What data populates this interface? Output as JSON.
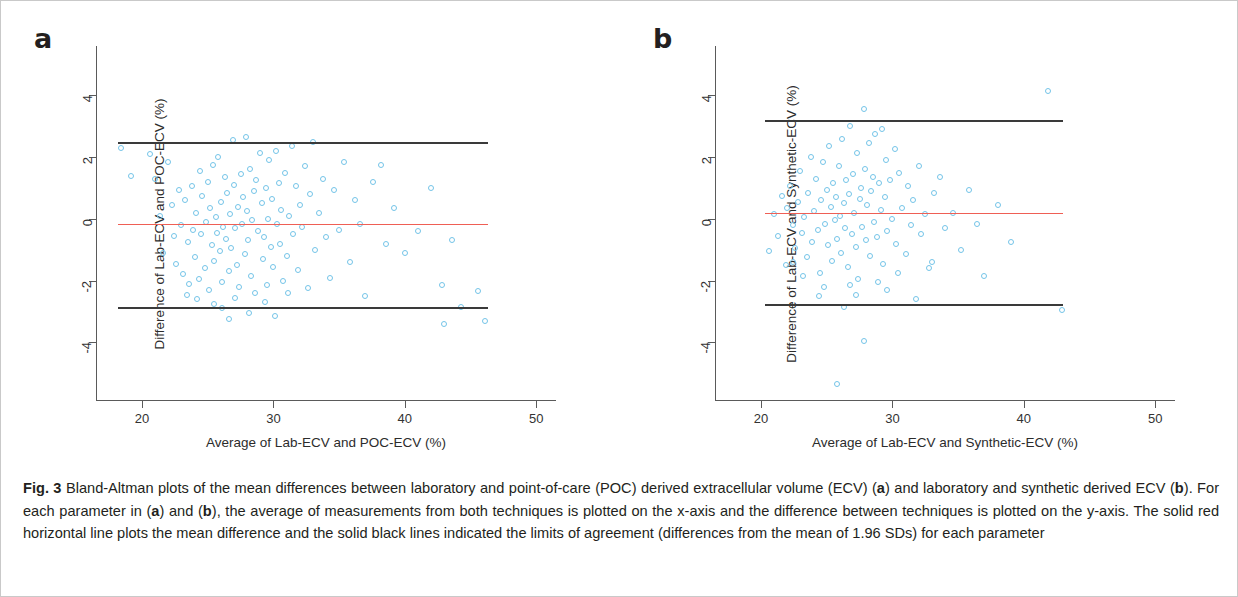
{
  "figure": {
    "label": "Fig. 3",
    "caption": "Bland-Altman plots of the mean differences between laboratory and point-of-care (POC) derived extracellular volume (ECV) (a) and laboratory and synthetic derived ECV (b). For each parameter in (a) and (b), the average of measurements from both techniques is plotted on the x-axis and the difference between techniques is plotted on the y-axis. The solid red horizontal line plots the mean difference and the solid black lines indicated the limits of agreement (differences from the mean of 1.96 SDs) for each parameter",
    "panel_a_letter": "a",
    "panel_b_letter": "b",
    "colors": {
      "points": "#74c4e8",
      "mean_line": "#ef5f55",
      "loa_line": "#3a3a3a",
      "axis": "#5a5a5a"
    }
  },
  "chart_data": [
    {
      "type": "scatter",
      "panel": "a",
      "title": "",
      "xlabel": "Average of Lab-ECV and POC-ECV (%)",
      "ylabel": "Difference of Lab-ECV and POC-ECV (%)",
      "xlim": [
        16.5,
        51.5
      ],
      "ylim": [
        -5.9,
        5.6
      ],
      "xticks": [
        20,
        30,
        40,
        50
      ],
      "yticks": [
        -4,
        -2,
        0,
        2,
        4
      ],
      "grid": false,
      "legend": "none",
      "mean_difference": -0.15,
      "upper_limit_of_agreement": 2.5,
      "lower_limit_of_agreement": -2.85,
      "reference_line_x_range": [
        18.2,
        46.3
      ],
      "points": [
        [
          18.4,
          2.3
        ],
        [
          19.2,
          1.4
        ],
        [
          20.6,
          2.1
        ],
        [
          21.0,
          1.3
        ],
        [
          21.4,
          0.1
        ],
        [
          21.6,
          -1.1
        ],
        [
          22.0,
          1.85
        ],
        [
          22.3,
          0.45
        ],
        [
          22.4,
          -0.55
        ],
        [
          22.6,
          -1.45
        ],
        [
          22.8,
          0.95
        ],
        [
          23.0,
          -0.2
        ],
        [
          23.1,
          -1.8
        ],
        [
          23.3,
          0.6
        ],
        [
          23.5,
          -0.75
        ],
        [
          23.6,
          -2.1
        ],
        [
          23.8,
          1.05
        ],
        [
          23.9,
          -0.35
        ],
        [
          24.0,
          -1.25
        ],
        [
          24.1,
          0.2
        ],
        [
          24.3,
          -1.95
        ],
        [
          24.4,
          1.55
        ],
        [
          24.5,
          -0.5
        ],
        [
          24.6,
          0.75
        ],
        [
          24.8,
          -1.6
        ],
        [
          24.9,
          -0.1
        ],
        [
          25.0,
          1.2
        ],
        [
          25.1,
          -2.3
        ],
        [
          25.2,
          0.35
        ],
        [
          25.3,
          -0.85
        ],
        [
          25.4,
          1.75
        ],
        [
          25.5,
          -1.35
        ],
        [
          25.6,
          0.05
        ],
        [
          25.7,
          -0.45
        ],
        [
          25.8,
          2.0
        ],
        [
          25.9,
          -1.05
        ],
        [
          26.0,
          0.55
        ],
        [
          26.1,
          -2.05
        ],
        [
          26.2,
          -0.25
        ],
        [
          26.3,
          1.35
        ],
        [
          26.4,
          -0.65
        ],
        [
          26.5,
          0.85
        ],
        [
          26.6,
          -1.7
        ],
        [
          26.7,
          0.15
        ],
        [
          26.8,
          -0.95
        ],
        [
          26.9,
          2.55
        ],
        [
          27.0,
          1.1
        ],
        [
          27.1,
          -0.3
        ],
        [
          27.2,
          -1.5
        ],
        [
          27.3,
          0.4
        ],
        [
          27.4,
          -2.2
        ],
        [
          27.5,
          1.45
        ],
        [
          27.6,
          -0.15
        ],
        [
          27.7,
          0.7
        ],
        [
          27.8,
          -1.15
        ],
        [
          27.9,
          2.65
        ],
        [
          28.0,
          0.25
        ],
        [
          28.1,
          -0.7
        ],
        [
          28.2,
          1.6
        ],
        [
          28.3,
          -1.85
        ],
        [
          28.4,
          -0.05
        ],
        [
          28.5,
          0.9
        ],
        [
          28.6,
          -2.4
        ],
        [
          28.7,
          1.25
        ],
        [
          28.8,
          -0.4
        ],
        [
          29.0,
          2.15
        ],
        [
          29.1,
          0.5
        ],
        [
          29.2,
          -1.3
        ],
        [
          29.3,
          -0.6
        ],
        [
          29.4,
          1.0
        ],
        [
          29.5,
          -2.15
        ],
        [
          29.6,
          0.0
        ],
        [
          29.7,
          1.9
        ],
        [
          29.8,
          -0.9
        ],
        [
          29.9,
          0.65
        ],
        [
          30.0,
          -1.55
        ],
        [
          30.2,
          2.2
        ],
        [
          30.3,
          -0.15
        ],
        [
          30.4,
          1.15
        ],
        [
          30.5,
          -0.8
        ],
        [
          30.6,
          0.3
        ],
        [
          30.7,
          -2.0
        ],
        [
          30.9,
          1.5
        ],
        [
          31.0,
          -1.2
        ],
        [
          31.2,
          0.1
        ],
        [
          31.4,
          2.35
        ],
        [
          31.5,
          -0.5
        ],
        [
          31.7,
          1.05
        ],
        [
          31.9,
          -1.65
        ],
        [
          32.0,
          0.45
        ],
        [
          32.2,
          -0.25
        ],
        [
          32.4,
          1.7
        ],
        [
          32.6,
          -2.25
        ],
        [
          32.8,
          0.8
        ],
        [
          33.0,
          2.5
        ],
        [
          33.2,
          -1.0
        ],
        [
          33.5,
          0.2
        ],
        [
          33.8,
          1.3
        ],
        [
          34.0,
          -0.6
        ],
        [
          34.3,
          -1.9
        ],
        [
          34.6,
          0.95
        ],
        [
          35.0,
          -0.35
        ],
        [
          35.4,
          1.85
        ],
        [
          35.8,
          -1.4
        ],
        [
          36.2,
          0.6
        ],
        [
          36.6,
          -0.15
        ],
        [
          37.0,
          -2.5
        ],
        [
          37.6,
          1.2
        ],
        [
          38.2,
          1.75
        ],
        [
          38.6,
          -0.8
        ],
        [
          39.2,
          0.35
        ],
        [
          40.0,
          -1.1
        ],
        [
          41.0,
          -0.4
        ],
        [
          42.0,
          1.0
        ],
        [
          42.8,
          -2.15
        ],
        [
          43.0,
          -3.4
        ],
        [
          43.6,
          -0.7
        ],
        [
          44.3,
          -2.85
        ],
        [
          45.6,
          -2.35
        ],
        [
          46.1,
          -3.3
        ],
        [
          24.2,
          -2.6
        ],
        [
          25.45,
          -2.75
        ],
        [
          26.05,
          -2.9
        ],
        [
          27.05,
          -2.55
        ],
        [
          28.15,
          -3.05
        ],
        [
          23.4,
          -2.45
        ],
        [
          29.35,
          -2.7
        ],
        [
          30.1,
          -3.15
        ],
        [
          31.1,
          -2.4
        ],
        [
          26.6,
          -3.25
        ]
      ]
    },
    {
      "type": "scatter",
      "panel": "b",
      "title": "",
      "xlabel": "Average of Lab-ECV and Synthetic-ECV (%)",
      "ylabel": "Difference of Lab-ECV and Synthetic-ECV (%)",
      "xlim": [
        16.5,
        51.5
      ],
      "ylim": [
        -5.9,
        5.6
      ],
      "xticks": [
        20,
        30,
        40,
        50
      ],
      "yticks": [
        -4,
        -2,
        0,
        2,
        4
      ],
      "grid": false,
      "legend": "none",
      "mean_difference": 0.2,
      "upper_limit_of_agreement": 3.2,
      "lower_limit_of_agreement": -2.75,
      "reference_line_x_range": [
        20.3,
        43.0
      ],
      "points": [
        [
          20.6,
          -1.05
        ],
        [
          21.0,
          0.15
        ],
        [
          21.3,
          -0.55
        ],
        [
          21.6,
          0.75
        ],
        [
          21.9,
          -1.5
        ],
        [
          22.0,
          0.35
        ],
        [
          22.2,
          1.05
        ],
        [
          22.4,
          -0.2
        ],
        [
          22.6,
          -0.95
        ],
        [
          22.8,
          0.55
        ],
        [
          23.0,
          1.55
        ],
        [
          23.1,
          -0.45
        ],
        [
          23.3,
          0.05
        ],
        [
          23.5,
          -1.25
        ],
        [
          23.6,
          0.85
        ],
        [
          23.8,
          2.0
        ],
        [
          23.9,
          -0.75
        ],
        [
          24.0,
          0.25
        ],
        [
          24.2,
          1.3
        ],
        [
          24.3,
          -0.35
        ],
        [
          24.5,
          -1.75
        ],
        [
          24.6,
          0.6
        ],
        [
          24.7,
          1.85
        ],
        [
          24.9,
          -0.15
        ],
        [
          25.0,
          0.95
        ],
        [
          25.1,
          -0.85
        ],
        [
          25.2,
          2.35
        ],
        [
          25.3,
          0.4
        ],
        [
          25.4,
          -1.35
        ],
        [
          25.5,
          1.15
        ],
        [
          25.6,
          -0.05
        ],
        [
          25.7,
          0.7
        ],
        [
          25.8,
          -0.65
        ],
        [
          25.9,
          1.7
        ],
        [
          26.0,
          0.1
        ],
        [
          26.1,
          -1.1
        ],
        [
          26.2,
          2.6
        ],
        [
          26.3,
          0.5
        ],
        [
          26.4,
          -0.3
        ],
        [
          26.5,
          1.25
        ],
        [
          26.6,
          -1.55
        ],
        [
          26.7,
          0.8
        ],
        [
          26.8,
          3.0
        ],
        [
          26.9,
          -0.5
        ],
        [
          27.0,
          1.45
        ],
        [
          27.1,
          0.2
        ],
        [
          27.2,
          -0.9
        ],
        [
          27.3,
          2.15
        ],
        [
          27.4,
          -1.95
        ],
        [
          27.5,
          0.65
        ],
        [
          27.6,
          1.0
        ],
        [
          27.7,
          -0.25
        ],
        [
          27.8,
          3.55
        ],
        [
          27.9,
          1.6
        ],
        [
          28.0,
          -0.7
        ],
        [
          28.1,
          0.45
        ],
        [
          28.2,
          2.45
        ],
        [
          28.3,
          -1.2
        ],
        [
          28.4,
          0.9
        ],
        [
          28.5,
          1.35
        ],
        [
          28.6,
          -0.1
        ],
        [
          28.7,
          2.75
        ],
        [
          28.8,
          -0.6
        ],
        [
          29.0,
          1.15
        ],
        [
          29.1,
          0.3
        ],
        [
          29.2,
          2.9
        ],
        [
          29.3,
          -1.45
        ],
        [
          29.4,
          0.7
        ],
        [
          29.5,
          1.9
        ],
        [
          29.6,
          -0.4
        ],
        [
          29.8,
          1.25
        ],
        [
          30.0,
          0.0
        ],
        [
          30.2,
          2.25
        ],
        [
          30.3,
          -0.8
        ],
        [
          30.5,
          1.5
        ],
        [
          30.7,
          0.35
        ],
        [
          31.0,
          -1.15
        ],
        [
          31.2,
          1.05
        ],
        [
          31.4,
          -0.2
        ],
        [
          31.6,
          0.6
        ],
        [
          32.0,
          1.7
        ],
        [
          32.2,
          -0.5
        ],
        [
          32.5,
          0.15
        ],
        [
          32.8,
          -1.6
        ],
        [
          33.2,
          0.85
        ],
        [
          33.6,
          1.35
        ],
        [
          34.0,
          -0.3
        ],
        [
          34.6,
          0.2
        ],
        [
          35.2,
          -1.0
        ],
        [
          35.8,
          0.95
        ],
        [
          36.4,
          -0.15
        ],
        [
          37.0,
          -1.85
        ],
        [
          38.0,
          0.45
        ],
        [
          39.0,
          -0.75
        ],
        [
          41.8,
          4.15
        ],
        [
          42.9,
          -2.95
        ],
        [
          27.8,
          -3.95
        ],
        [
          26.3,
          -2.85
        ],
        [
          25.8,
          -5.35
        ],
        [
          24.8,
          -2.2
        ],
        [
          23.2,
          -1.85
        ],
        [
          28.9,
          -2.05
        ],
        [
          30.4,
          -1.75
        ],
        [
          31.8,
          -2.6
        ],
        [
          27.2,
          -2.45
        ],
        [
          24.4,
          -2.5
        ],
        [
          29.6,
          -2.3
        ],
        [
          33.0,
          -1.4
        ],
        [
          22.4,
          -1.4
        ],
        [
          26.8,
          -2.15
        ]
      ]
    }
  ]
}
